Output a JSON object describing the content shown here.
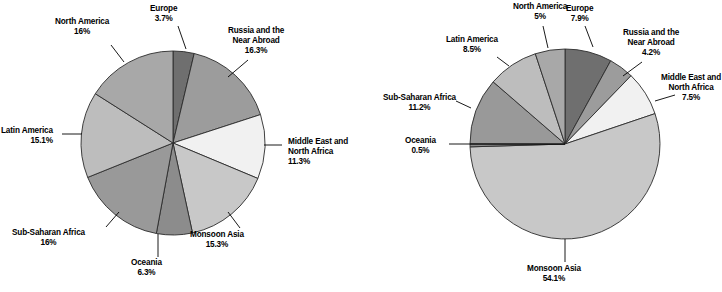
{
  "chart_data": [
    {
      "type": "pie",
      "title": "",
      "id": "left",
      "center": [
        173,
        143
      ],
      "radius": 92,
      "start_angle": -90,
      "legend": "labels-outside",
      "categories": [
        "Europe",
        "Russia and the Near Abroad",
        "Middle East and North Africa",
        "Monsoon Asia",
        "Oceania",
        "Sub-Saharan Africa",
        "Latin America",
        "North America"
      ],
      "values": [
        3.7,
        16.3,
        11.3,
        15.3,
        6.3,
        16,
        15.1,
        16
      ],
      "labels": [
        "3.7%",
        "16.3%",
        "11.3%",
        "15.3%",
        "6.3%",
        "16%",
        "15.1%",
        "16%"
      ],
      "colors": [
        "#6f6f6f",
        "#9c9c9c",
        "#f1f1f1",
        "#c8c8c8",
        "#8c8c8c",
        "#999999",
        "#bdbdbd",
        "#a8a8a8"
      ],
      "slice_labels": [
        {
          "name": "Europe",
          "pct": "3.7%",
          "x": 150,
          "y": 4,
          "align": "center",
          "leader": [
            [
              178,
              26
            ],
            [
              186,
              49
            ]
          ]
        },
        {
          "name_l1": "Russia and the",
          "name_l2": "Near Abroad",
          "pct": "16.3%",
          "x": 228,
          "y": 26,
          "align": "center",
          "leader": [
            [
              248,
              60
            ],
            [
              228,
              77
            ]
          ]
        },
        {
          "name_l1": "Middle East and",
          "name_l2": "North Africa",
          "pct": "11.3%",
          "x": 288,
          "y": 137,
          "align": "left",
          "leader": [
            [
              282,
              145
            ],
            [
              264,
              145
            ]
          ]
        },
        {
          "name": "Monsoon Asia",
          "pct": "15.3%",
          "x": 190,
          "y": 230,
          "align": "center",
          "leader": [
            [
              240,
              228
            ],
            [
              228,
              212
            ]
          ]
        },
        {
          "name": "Oceania",
          "pct": "6.3%",
          "x": 131,
          "y": 258,
          "align": "center",
          "leader": [
            [
              158,
              257
            ],
            [
              158,
              234
            ]
          ]
        },
        {
          "name": "Sub-Saharan Africa",
          "pct": "16%",
          "x": 12,
          "y": 228,
          "align": "center",
          "leader": [
            [
              106,
              227
            ],
            [
              119,
              212
            ]
          ]
        },
        {
          "name": "Latin America",
          "pct": "15.1%",
          "x": 1,
          "y": 126,
          "align": "right",
          "leader": [
            [
              62,
              134
            ],
            [
              82,
              134
            ]
          ]
        },
        {
          "name": "North America",
          "pct": "16%",
          "x": 55,
          "y": 17,
          "align": "center",
          "leader": [
            [
              111,
              45
            ],
            [
              124,
              62
            ]
          ]
        }
      ]
    },
    {
      "type": "pie",
      "title": "",
      "id": "right",
      "center": [
        204,
        144
      ],
      "radius": 95,
      "start_angle": -90,
      "legend": "labels-outside",
      "categories": [
        "Europe",
        "Russia and the Near Abroad",
        "Middle East and North Africa",
        "Monsoon Asia",
        "Oceania",
        "Sub-Saharan Africa",
        "Latin America",
        "North America"
      ],
      "values": [
        7.9,
        4.2,
        7.5,
        54.1,
        0.5,
        11.2,
        8.5,
        5.0
      ],
      "labels": [
        "7.9%",
        "4.2%",
        "7.5%",
        "54.1%",
        "0.5%",
        "11.2%",
        "8.5%",
        "5%"
      ],
      "colors": [
        "#6f6f6f",
        "#9c9c9c",
        "#f1f1f1",
        "#c8c8c8",
        "#8c8c8c",
        "#999999",
        "#bdbdbd",
        "#a8a8a8"
      ],
      "slice_labels": [
        {
          "name": "Europe",
          "pct": "7.9%",
          "x": 205,
          "y": 4,
          "align": "center",
          "leader": [
            [
              224,
              26
            ],
            [
              232,
              47
            ]
          ]
        },
        {
          "name_l1": "Russia and the",
          "name_l2": "Near Abroad",
          "pct": "4.2%",
          "x": 262,
          "y": 28,
          "align": "center",
          "leader": [
            [
              281,
              62
            ],
            [
              262,
              76
            ]
          ]
        },
        {
          "name_l1": "Middle East and",
          "name_l2": "North Africa",
          "pct": "7.5%",
          "x": 300,
          "y": 73,
          "align": "center",
          "leader": [
            [
              314,
              95
            ],
            [
              294,
              101
            ]
          ]
        },
        {
          "name": "Monsoon Asia",
          "pct": "54.1%",
          "x": 166,
          "y": 264,
          "align": "center",
          "leader": [
            [
              204,
              262
            ],
            [
              204,
              239
            ]
          ]
        },
        {
          "name": "Oceania",
          "pct": "0.5%",
          "x": 44,
          "y": 136,
          "align": "center",
          "leader": [
            [
              88,
              144
            ],
            [
              204,
              144
            ]
          ]
        },
        {
          "name": "Sub-Saharan Africa",
          "pct": "11.2%",
          "x": 22,
          "y": 93,
          "align": "center",
          "leader": [
            [
              95,
              101
            ],
            [
              110,
              108
            ]
          ]
        },
        {
          "name": "Latin America",
          "pct": "8.5%",
          "x": 85,
          "y": 35,
          "align": "center",
          "leader": [
            [
              136,
              57
            ],
            [
              148,
              66
            ]
          ]
        },
        {
          "name": "North America",
          "pct": "5%",
          "x": 152,
          "y": 2,
          "align": "center",
          "leader": [
            [
              182,
              26
            ],
            [
              187,
              48
            ]
          ]
        }
      ]
    }
  ]
}
